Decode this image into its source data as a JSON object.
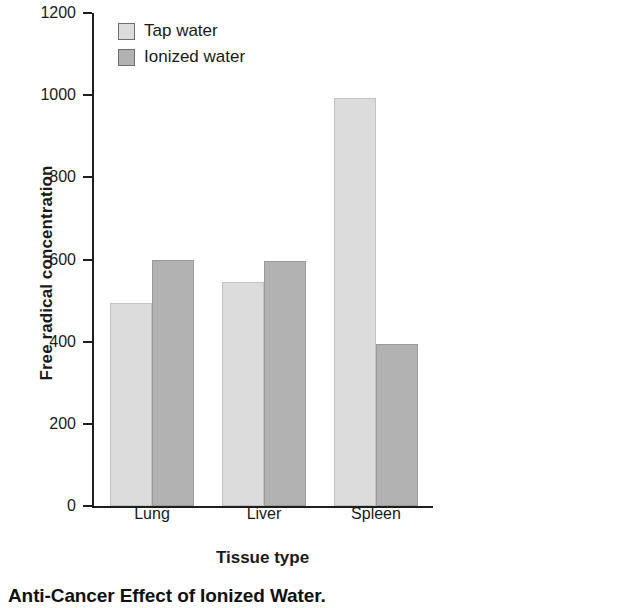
{
  "chart_data": {
    "type": "bar",
    "title": "",
    "caption": "Anti-Cancer Effect of Ionized Water.",
    "xlabel": "Tissue type",
    "ylabel": "Free radical concentration",
    "categories": [
      "Lung",
      "Liver",
      "Spleen"
    ],
    "series": [
      {
        "name": "Tap water",
        "color": "#dcdcdc",
        "values": [
          495,
          545,
          993
        ]
      },
      {
        "name": "Ionized water",
        "color": "#b2b2b2",
        "values": [
          600,
          597,
          395
        ]
      }
    ],
    "ylim": [
      0,
      1200
    ],
    "yticks": [
      0,
      200,
      400,
      600,
      800,
      1000,
      1200
    ],
    "ytick_labels": [
      "0",
      "200",
      "400",
      "600",
      "800",
      "1000",
      "1200"
    ],
    "grid": false,
    "legend_position": "top-left-inside"
  }
}
